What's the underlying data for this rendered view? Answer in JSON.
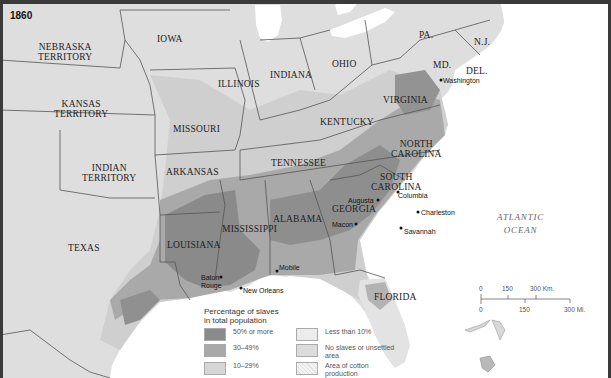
{
  "map": {
    "year": "1860",
    "colors": {
      "pct_50_or_more": "#8a8a8a",
      "pct_30_49": "#a9a9a9",
      "pct_10_29": "#cfcfcf",
      "less_than_10": "#e9e9e9",
      "no_slaves_unsettled": "#dcdcdc",
      "cotton_area": "#f2f2f2",
      "water": "#ffffff",
      "border": "#555555"
    },
    "territories": [
      {
        "name": "NEBRASKA TERRITORY",
        "line1": "NEBRASKA",
        "line2": "TERRITORY"
      },
      {
        "name": "KANSAS TERRITORY",
        "line1": "KANSAS",
        "line2": "TERRITORY"
      },
      {
        "name": "INDIAN TERRITORY",
        "line1": "INDIAN",
        "line2": "TERRITORY"
      }
    ],
    "states": {
      "iowa": "IOWA",
      "illinois": "ILLINOIS",
      "indiana": "INDIANA",
      "ohio": "OHIO",
      "pa": "PA.",
      "nj": "N.J.",
      "md": "MD.",
      "del": "DEL.",
      "missouri": "MISSOURI",
      "kentucky": "KENTUCKY",
      "virginia": "VIRGINIA",
      "arkansas": "ARKANSAS",
      "tennessee": "TENNESSEE",
      "north_carolina_1": "NORTH",
      "north_carolina_2": "CAROLINA",
      "south_carolina_1": "SOUTH",
      "south_carolina_2": "CAROLINA",
      "texas": "TEXAS",
      "louisiana": "LOUISIANA",
      "mississippi": "MISSISSIPPI",
      "alabama": "ALABAMA",
      "georgia": "GEORGIA",
      "florida": "FLORIDA"
    },
    "cities": {
      "washington": "Washington",
      "columbia": "Columbia",
      "augusta": "Augusta",
      "charleston": "Charleston",
      "macon": "Macon",
      "savannah": "Savannah",
      "baton_rouge_1": "Baton",
      "baton_rouge_2": "Rouge",
      "new_orleans": "New Orleans",
      "mobile": "Mobile"
    },
    "ocean": {
      "line1": "ATLANTIC",
      "line2": "OCEAN"
    },
    "legend": {
      "title_line1": "Percentage of slaves",
      "title_line2": "in total population",
      "items": [
        {
          "label": "50% or more"
        },
        {
          "label": "Less than 10%"
        },
        {
          "label": "30–49%"
        },
        {
          "label": "No slaves or unsettled area"
        },
        {
          "label": "10–29%"
        },
        {
          "label": "Area of cotton production"
        }
      ]
    },
    "scale": {
      "km_0": "0",
      "km_150": "150",
      "km_300": "300 Km.",
      "mi_0": "0",
      "mi_150": "150",
      "mi_300": "300 Mi."
    }
  }
}
